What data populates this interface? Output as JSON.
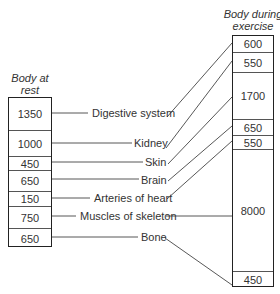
{
  "left_header": [
    "Body at",
    "rest"
  ],
  "right_header": [
    "Body during",
    "exercise"
  ],
  "rest_values": [
    {
      "value": "1350",
      "top": 0,
      "height": 32
    },
    {
      "value": "1000",
      "top": 32,
      "height": 26
    },
    {
      "value": "450",
      "top": 58,
      "height": 14
    },
    {
      "value": "650",
      "top": 72,
      "height": 21
    },
    {
      "value": "150",
      "top": 93,
      "height": 15
    },
    {
      "value": "750",
      "top": 108,
      "height": 22
    },
    {
      "value": "650",
      "top": 130,
      "height": 20
    }
  ],
  "exercise_values": [
    {
      "value": "600",
      "top": 0,
      "height": 16
    },
    {
      "value": "550",
      "top": 16,
      "height": 20
    },
    {
      "value": "1700",
      "top": 36,
      "height": 47
    },
    {
      "value": "650",
      "top": 83,
      "height": 16
    },
    {
      "value": "550",
      "top": 99,
      "height": 14
    },
    {
      "value": "8000",
      "top": 113,
      "height": 122
    },
    {
      "value": "450",
      "top": 235,
      "height": 17
    }
  ],
  "organs": [
    {
      "name": "Digestive system",
      "rest": 1350,
      "exercise": 600
    },
    {
      "name": "Kidney",
      "rest": 1000,
      "exercise": 550
    },
    {
      "name": "Skin",
      "rest": 450,
      "exercise": 1700
    },
    {
      "name": "Brain",
      "rest": 650,
      "exercise": 650
    },
    {
      "name": "Arteries of heart",
      "rest": 150,
      "exercise": 550
    },
    {
      "name": "Muscles of skeleton",
      "rest": 750,
      "exercise": 8000
    },
    {
      "name": "Bone",
      "rest": 650,
      "exercise": 450
    }
  ]
}
